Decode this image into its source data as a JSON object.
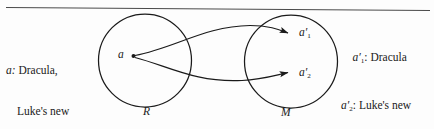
{
  "figure": {
    "background_color": "#fdfdfd",
    "ink_color": "#1a1a1a",
    "rule": {
      "name": "top-horizontal-rule",
      "present": true
    }
  },
  "left_caption": {
    "symbol": "a:",
    "line1": "Dracula,",
    "line2": "Luke's new",
    "line3": "neighbor"
  },
  "right_captions": [
    {
      "symbol_base": "a",
      "symbol_prime": "′",
      "symbol_sub": "1",
      "separator": ": ",
      "line1": "Dracula"
    },
    {
      "symbol_base": "a",
      "symbol_prime": "′",
      "symbol_sub": "2",
      "separator": ": ",
      "line1": "Luke's new",
      "line2": "neighbor"
    }
  ],
  "sets": [
    {
      "name": "R",
      "label": "R",
      "cx": 145,
      "cy": 60,
      "r": 46
    },
    {
      "name": "M",
      "label": "M",
      "cx": 291,
      "cy": 61,
      "r": 46
    }
  ],
  "points": [
    {
      "name": "a",
      "label": "a",
      "x": 133,
      "y": 56
    },
    {
      "name": "a-prime-1",
      "label_base": "a",
      "label_prime": "′",
      "label_sub": "1",
      "x": 296,
      "y": 33
    },
    {
      "name": "a-prime-2",
      "label_base": "a",
      "label_prime": "′",
      "label_sub": "2",
      "x": 296,
      "y": 73
    }
  ],
  "arrows": [
    {
      "name": "arrow-a-to-a-prime-1",
      "from": "a",
      "to": "a-prime-1"
    },
    {
      "name": "arrow-a-to-a-prime-2",
      "from": "a",
      "to": "a-prime-2"
    }
  ]
}
